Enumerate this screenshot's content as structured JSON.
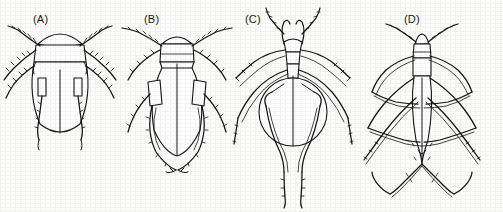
{
  "figure": {
    "kind": "scientific-illustration-plate",
    "background_color": "#fdfdfc",
    "ink_color": "#141414",
    "panel_count": 4
  },
  "panels": [
    {
      "id": "A",
      "label": "(A)",
      "label_x": 33,
      "label_y": 13,
      "common_form": "broad oval beetle-like bug",
      "body_outline": "oval elytra with rounded head arc and trapezoid pronotum",
      "midline": true,
      "leg_pairs": 3,
      "leg_style": "splayed, fringed with setae",
      "antennae": 2
    },
    {
      "id": "B",
      "label": "(B)",
      "label_x": 144,
      "label_y": 13,
      "common_form": "elongate oval bug with rectangular pronotum",
      "body_outline": "rounded head cap, squared pronotum, tapering oval abdomen",
      "midline": true,
      "leg_pairs": 3,
      "leg_style": "long fringed hind legs arcing below abdomen",
      "antennae": 2
    },
    {
      "id": "C",
      "label": "(C)",
      "label_x": 245,
      "label_y": 13,
      "common_form": "round-bodied bug with horned head",
      "body_outline": "circular abdomen, narrow thorax, paired curved head processes",
      "midline": true,
      "leg_pairs": 3,
      "leg_style": "long slender legs converging in a V below body",
      "antennae": 2
    },
    {
      "id": "D",
      "label": "(D)",
      "label_x": 404,
      "label_y": 13,
      "common_form": "slender elongate water strider-like bug",
      "body_outline": "narrow lanceolate abdomen, segmented thorax, small head",
      "midline": true,
      "leg_pairs": 3,
      "leg_style": "very long angular legs crossing in zigzag pattern",
      "antennae": 2
    }
  ]
}
